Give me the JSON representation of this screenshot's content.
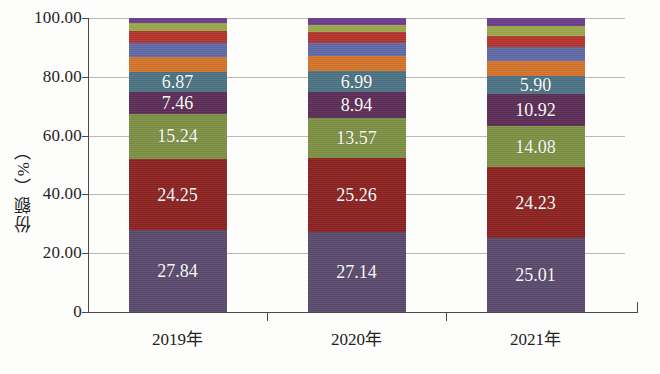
{
  "chart_data": {
    "type": "bar",
    "stacked": true,
    "title": "",
    "xlabel": "",
    "ylabel": "份额（%）",
    "ylim": [
      0,
      100
    ],
    "ytick_labels": [
      "0",
      "20.00",
      "40.00",
      "60.00",
      "80.00",
      "100.00"
    ],
    "ytick_values": [
      0,
      20,
      40,
      60,
      80,
      100
    ],
    "grid": true,
    "legend": "none",
    "categories": [
      "2019年",
      "2020年",
      "2021年"
    ],
    "series": [
      {
        "name": "其他",
        "color": "#5a4a6e",
        "values": [
          27.84,
          27.14,
          25.01
        ],
        "labeled": true
      },
      {
        "name": "企业二",
        "color": "#8c2220",
        "values": [
          24.25,
          25.26,
          24.23
        ],
        "labeled": true
      },
      {
        "name": "企业三",
        "color": "#7d9144",
        "values": [
          15.24,
          13.57,
          14.08
        ],
        "labeled": true
      },
      {
        "name": "企业四",
        "color": "#5c2d57",
        "values": [
          7.46,
          8.94,
          10.92
        ],
        "labeled": true
      },
      {
        "name": "企业五",
        "color": "#4b7384",
        "values": [
          6.87,
          6.99,
          5.9
        ],
        "labeled": true
      },
      {
        "name": "企业六",
        "color": "#d4742b",
        "values": [
          5.2,
          5.1,
          5.4
        ],
        "labeled": false
      },
      {
        "name": "企业七",
        "color": "#5f6aa8",
        "values": [
          4.6,
          4.5,
          4.6
        ],
        "labeled": false
      },
      {
        "name": "企业八",
        "color": "#b5342c",
        "values": [
          4.1,
          3.7,
          3.9
        ],
        "labeled": false
      },
      {
        "name": "企业九",
        "color": "#9aa84a",
        "values": [
          2.7,
          2.5,
          3.2
        ],
        "labeled": false
      },
      {
        "name": "企业十",
        "color": "#6b3d8c",
        "values": [
          1.73,
          2.3,
          2.76
        ],
        "labeled": false
      }
    ]
  },
  "axis": {
    "y_title": "份额（%）"
  }
}
